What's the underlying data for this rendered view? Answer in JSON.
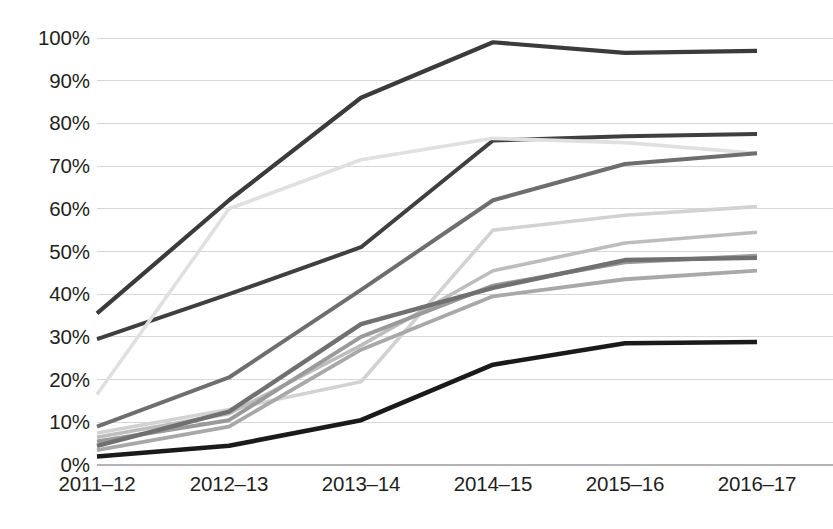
{
  "chart_data": {
    "type": "line",
    "title": "",
    "subtitle": "",
    "xlabel": "",
    "ylabel": "",
    "categories": [
      "2011–12",
      "2012–13",
      "2013–14",
      "2014–15",
      "2015–16",
      "2016–17"
    ],
    "x_tick_labels": [
      "2011–12",
      "2012–13",
      "2013–14",
      "2014–15",
      "2015–16",
      "2016–17"
    ],
    "y_tick_labels": [
      "100%",
      "90%",
      "80%",
      "70%",
      "60%",
      "50%",
      "40%",
      "30%",
      "20%",
      "10%",
      "0%"
    ],
    "y_tick_values": [
      100,
      90,
      80,
      70,
      60,
      50,
      40,
      30,
      20,
      10,
      0
    ],
    "ylim": [
      0,
      100
    ],
    "y_unit": "%",
    "grid": true,
    "grid_axis": "y",
    "legend": false,
    "legend_position": "none",
    "annotations": [],
    "series": [
      {
        "name": "series-1",
        "color": "#3b3b3b",
        "width": 4.2,
        "values": [
          35.5,
          62.0,
          86.0,
          99.0,
          96.5,
          97.0
        ]
      },
      {
        "name": "series-2",
        "color": "#3f3f3f",
        "width": 4.0,
        "values": [
          29.5,
          40.0,
          51.0,
          76.0,
          77.0,
          77.5
        ]
      },
      {
        "name": "series-3",
        "color": "#e0e0e0",
        "width": 3.6,
        "values": [
          16.5,
          60.0,
          71.5,
          76.5,
          75.5,
          73.0
        ]
      },
      {
        "name": "series-4",
        "color": "#6e6e6e",
        "width": 4.0,
        "values": [
          9.0,
          20.5,
          41.0,
          62.0,
          70.5,
          73.0
        ]
      },
      {
        "name": "series-5",
        "color": "#d2d2d2",
        "width": 3.6,
        "values": [
          7.5,
          13.0,
          19.5,
          55.0,
          58.5,
          60.5
        ]
      },
      {
        "name": "series-6",
        "color": "#bdbdbd",
        "width": 3.6,
        "values": [
          6.5,
          12.0,
          28.0,
          45.5,
          52.0,
          54.5
        ]
      },
      {
        "name": "series-7",
        "color": "#9a9a9a",
        "width": 4.0,
        "values": [
          5.5,
          10.5,
          30.0,
          42.0,
          47.5,
          49.0
        ]
      },
      {
        "name": "series-8",
        "color": "#707070",
        "width": 4.4,
        "values": [
          4.5,
          12.5,
          33.0,
          41.5,
          48.0,
          48.5
        ]
      },
      {
        "name": "series-9",
        "color": "#a8a8a8",
        "width": 3.8,
        "values": [
          3.5,
          9.0,
          27.0,
          39.5,
          43.5,
          45.5
        ]
      },
      {
        "name": "series-10",
        "color": "#1a1a1a",
        "width": 4.6,
        "values": [
          2.0,
          4.5,
          10.5,
          23.5,
          28.5,
          28.8
        ]
      }
    ],
    "plot_area": {
      "left": 97,
      "right": 757,
      "top": 38,
      "bottom": 465
    }
  }
}
